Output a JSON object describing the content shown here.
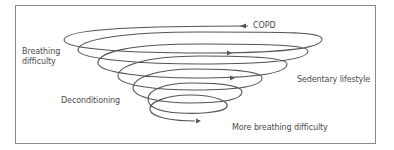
{
  "diagram": {
    "type": "downward spiral",
    "labels": {
      "copd": "COPD",
      "breathing_line1": "Breathing",
      "breathing_line2": "difficulty",
      "sedentary": "Sedentary lifestyle",
      "deconditioning": "Deconditioning",
      "more_breathing": "More breathing difficulty"
    },
    "colors": {
      "line": "#555555",
      "text": "#4a4a4a",
      "frame": "#8a8a8a"
    }
  }
}
